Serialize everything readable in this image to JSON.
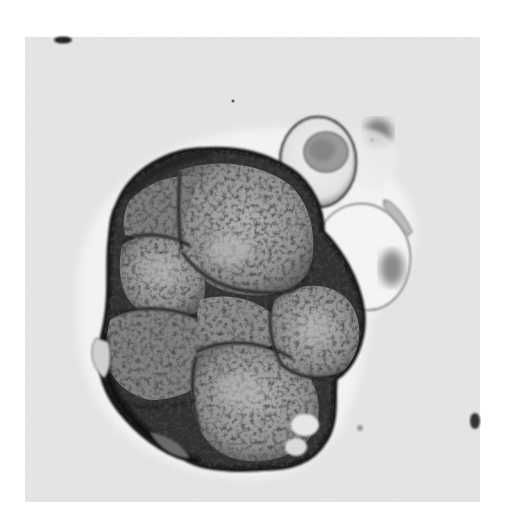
{
  "image": {
    "type": "micrograph",
    "colors": {
      "page_background": "#ffffff",
      "field_background": "#e8e8e8",
      "cell_fill": "#9a9a9a",
      "cell_border": "#1c1c1c",
      "light_cell": "#d8d8d8"
    },
    "field": {
      "x": 25,
      "y": 37,
      "width": 455,
      "height": 465
    }
  }
}
